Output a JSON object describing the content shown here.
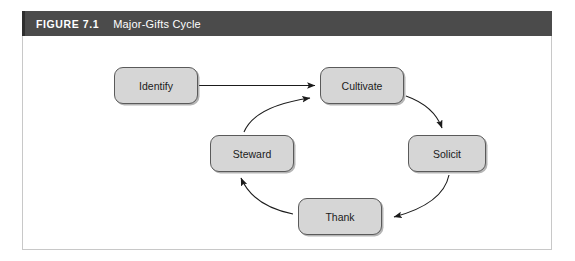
{
  "figure": {
    "number": "FIGURE 7.1",
    "title": "Major-Gifts Cycle",
    "header_bg": "#4b4b4b",
    "header_text_color": "#ffffff",
    "panel_bg": "#ffffff",
    "panel_border": "#c8c8c8"
  },
  "diagram": {
    "type": "cycle-flow",
    "node_fill": "#d6d6d6",
    "node_border": "#5a5a5a",
    "nodes": [
      {
        "id": "identify",
        "label": "Identify"
      },
      {
        "id": "cultivate",
        "label": "Cultivate"
      },
      {
        "id": "solicit",
        "label": "Solicit"
      },
      {
        "id": "thank",
        "label": "Thank"
      },
      {
        "id": "steward",
        "label": "Steward"
      }
    ],
    "edges": [
      {
        "from": "identify",
        "to": "cultivate",
        "style": "straight"
      },
      {
        "from": "cultivate",
        "to": "solicit",
        "style": "curved"
      },
      {
        "from": "solicit",
        "to": "thank",
        "style": "curved"
      },
      {
        "from": "thank",
        "to": "steward",
        "style": "curved"
      },
      {
        "from": "steward",
        "to": "cultivate",
        "style": "curved"
      }
    ]
  }
}
